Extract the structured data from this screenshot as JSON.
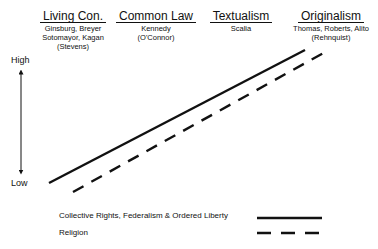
{
  "categories": [
    {
      "title": "Living Con.",
      "members": [
        "Ginsburg, Breyer",
        "Sotomayor, Kagan",
        "(Stevens)"
      ]
    },
    {
      "title": "Common Law",
      "members": [
        "Kennedy",
        "(O'Connor)"
      ]
    },
    {
      "title": "Textualism",
      "members": [
        "Scalia"
      ]
    },
    {
      "title": "Originalism",
      "members": [
        "Thomas, Roberts, Alito",
        "(Rehnquist)"
      ]
    }
  ],
  "axis": {
    "high": "High",
    "low": "Low"
  },
  "legend": [
    {
      "label": "Collective Rights, Federalism & Ordered Liberty",
      "style": "solid"
    },
    {
      "label": "Religion",
      "style": "dashed"
    }
  ],
  "colors": {
    "line": "#111111",
    "background": "#ffffff"
  }
}
